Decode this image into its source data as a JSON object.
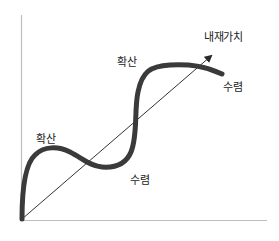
{
  "diagram": {
    "type": "concept-diagram",
    "axes": {
      "x_axis": {
        "label": ""
      },
      "y_axis": {
        "label": ""
      }
    },
    "trend_line": {
      "label": "내재가치",
      "style": "thin arrow",
      "color": "#333333"
    },
    "curve": {
      "style": "thick S-shaped oscillating curve",
      "color": "#3a3a3a"
    },
    "annotations": [
      {
        "id": "diverge-1",
        "text": "확산",
        "position": "first peak above trend line"
      },
      {
        "id": "converge-1",
        "text": "수렴",
        "position": "trough below trend line"
      },
      {
        "id": "diverge-2",
        "text": "확산",
        "position": "second peak above trend line"
      },
      {
        "id": "converge-2",
        "text": "수렴",
        "position": "curve end returning toward trend line"
      }
    ],
    "colors": {
      "axis": "#bbbbbb",
      "curve": "#3a3a3a",
      "trend": "#333333",
      "text": "#222222",
      "background": "#ffffff"
    }
  },
  "labels": {
    "value": "내재가치",
    "diverge_1": "확산",
    "converge_1": "수렴",
    "diverge_2": "확산",
    "converge_2": "수렴"
  }
}
